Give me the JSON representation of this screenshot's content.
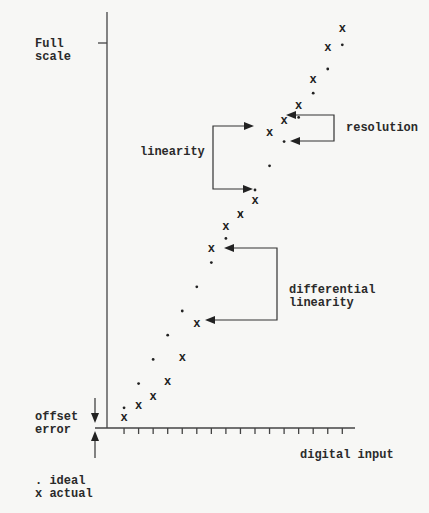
{
  "labels": {
    "full_scale_line1": "Full",
    "full_scale_line2": "scale",
    "resolution": "resolution",
    "linearity": "linearity",
    "differential_line1": "differential",
    "differential_line2": "linearity",
    "offset_line1": "offset",
    "offset_line2": "error",
    "x_axis": "digital input",
    "legend_ideal": ". ideal",
    "legend_actual": "x actual"
  },
  "markers": {
    "ideal": ".",
    "actual": "x"
  },
  "colors": {
    "ink": "#2a2a2a",
    "background": "#f7f7f5"
  },
  "chart_data": {
    "type": "scatter",
    "title": "",
    "xlabel": "digital input",
    "ylabel": "",
    "x_ticks": 16,
    "legend": [
      "ideal",
      "actual"
    ],
    "series": [
      {
        "name": "ideal",
        "marker": ".",
        "x": [
          1,
          2,
          3,
          4,
          5,
          6,
          7,
          8,
          9,
          10,
          11,
          12,
          13,
          14,
          15,
          16
        ],
        "y": [
          1,
          2,
          3,
          4,
          5,
          6,
          7,
          8,
          9,
          10,
          11,
          12,
          13,
          14,
          15,
          16
        ]
      },
      {
        "name": "actual",
        "marker": "x",
        "x": [
          1,
          2,
          3,
          4,
          5,
          6,
          7,
          8,
          9,
          10,
          11,
          12,
          13,
          14,
          15,
          16
        ],
        "y": [
          0.6,
          1.1,
          1.5,
          2.1,
          3.1,
          4.5,
          7.6,
          8.5,
          9.0,
          9.6,
          12.4,
          12.9,
          13.5,
          14.6,
          15.9,
          16.7
        ]
      }
    ],
    "annotations": [
      "Full scale",
      "resolution",
      "linearity",
      "differential linearity",
      "offset error"
    ]
  }
}
